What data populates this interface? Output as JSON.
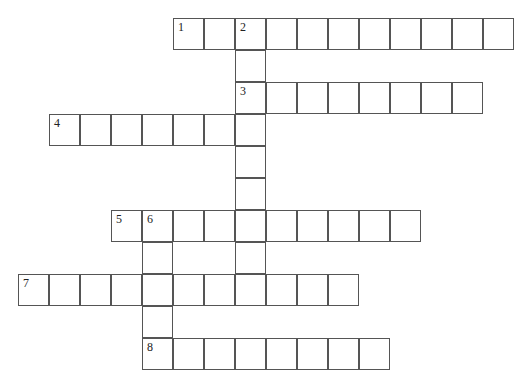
{
  "puzzle": {
    "type": "crossword",
    "cell_size": 31,
    "cell_height": 32,
    "origin_x": 18,
    "origin_y": 18,
    "entries": [
      {
        "number": "1",
        "direction": "across",
        "col": 5,
        "row": 0,
        "length": 11
      },
      {
        "number": "2",
        "direction": "down",
        "col": 7,
        "row": 0,
        "length": 9
      },
      {
        "number": "3",
        "direction": "across",
        "col": 7,
        "row": 2,
        "length": 8
      },
      {
        "number": "4",
        "direction": "across",
        "col": 1,
        "row": 3,
        "length": 7
      },
      {
        "number": "5",
        "direction": "across",
        "col": 3,
        "row": 6,
        "length": 10
      },
      {
        "number": "6",
        "direction": "down",
        "col": 4,
        "row": 6,
        "length": 5
      },
      {
        "number": "7",
        "direction": "across",
        "col": 0,
        "row": 8,
        "length": 11
      },
      {
        "number": "8",
        "direction": "across",
        "col": 4,
        "row": 10,
        "length": 8
      }
    ]
  }
}
